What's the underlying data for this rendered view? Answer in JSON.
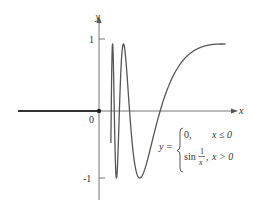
{
  "chart_data": {
    "type": "line",
    "title": "",
    "xlabel": "x",
    "ylabel": "y",
    "y_ticks": [
      {
        "value": 1,
        "label": "1"
      },
      {
        "value": -1,
        "label": "-1"
      }
    ],
    "origin_label": "0",
    "ylim": [
      -1.3,
      1.25
    ],
    "xlim": [
      -0.42,
      0.7
    ],
    "grid": false,
    "legend": null,
    "series": [
      {
        "name": "y = 0 for x ≤ 0",
        "x": [
          -0.42,
          0
        ],
        "y": [
          0,
          0
        ],
        "style": "thick"
      },
      {
        "name": "y = sin(1/x) for x > 0",
        "expression": "sin(1/x)",
        "domain": [
          0.0,
          0.66
        ]
      }
    ],
    "annotation": {
      "lhs": "y =",
      "cases": [
        {
          "expr": "0,",
          "cond": "x ≤ 0"
        },
        {
          "expr_prefix": "sin",
          "frac_num": "1",
          "frac_den": "x",
          "expr_suffix": ",",
          "cond": "x > 0"
        }
      ]
    },
    "points": [
      {
        "x": 0,
        "y": 0,
        "marker": "filled-dot"
      }
    ]
  },
  "colors": {
    "curve": "#555555",
    "axis": "#666666",
    "text": "#333333"
  }
}
